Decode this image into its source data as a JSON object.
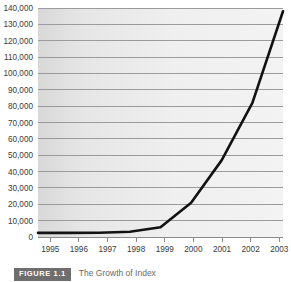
{
  "chart_data": {
    "type": "line",
    "title": "",
    "xlabel": "",
    "ylabel": "",
    "x": [
      1995,
      1996,
      1997,
      1998,
      1999,
      2000,
      2001,
      2002,
      2003
    ],
    "categories": [
      "1995",
      "1996",
      "1997",
      "1998",
      "1999",
      "2000",
      "2001",
      "2002",
      "2003"
    ],
    "values": [
      2500,
      2500,
      2600,
      3200,
      6000,
      21000,
      47000,
      82000,
      138000
    ],
    "series": [
      {
        "name": "",
        "values": [
          2500,
          2500,
          2600,
          3200,
          6000,
          21000,
          47000,
          82000,
          138000
        ]
      }
    ],
    "ylim": [
      0,
      140000
    ],
    "xlim": [
      1995,
      2003
    ],
    "ytick_labels": [
      "0",
      "10,000",
      "20,000",
      "30,000",
      "40,000",
      "50,000",
      "60,000",
      "70,000",
      "80,000",
      "90,000",
      "100,000",
      "110,000",
      "120,000",
      "130,000",
      "140,000"
    ],
    "ytick_values": [
      0,
      10000,
      20000,
      30000,
      40000,
      50000,
      60000,
      70000,
      80000,
      90000,
      100000,
      110000,
      120000,
      130000,
      140000
    ],
    "xtick_labels": [
      "1995",
      "1996",
      "1997",
      "1998",
      "1999",
      "2000",
      "2001",
      "2002",
      "2003"
    ],
    "grid": true,
    "grid_orientation": "horizontal",
    "legend": false,
    "legend_position": "none",
    "line_color": "#121212",
    "plot_background": "#ededed",
    "gridline_color": "#9b9b9b"
  },
  "caption": {
    "badge_label": "FIGURE 1.1",
    "text": "The Growth of Index"
  }
}
